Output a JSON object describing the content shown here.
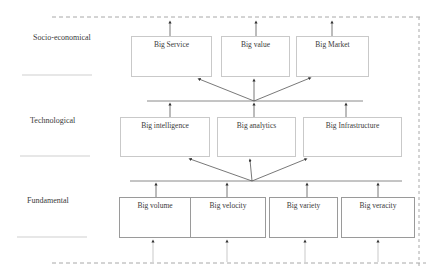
{
  "diagram": {
    "layers": [
      {
        "name": "Socio-economical",
        "boxes": [
          "Big Service",
          "Big value",
          "Big Market"
        ]
      },
      {
        "name": "Technological",
        "boxes": [
          "Big intelligence",
          "Big analytics",
          "Big Infrastructure"
        ]
      },
      {
        "name": "Fundamental",
        "boxes": [
          "Big volume",
          "Big velocity",
          "Big variety",
          "Big veracity"
        ]
      }
    ],
    "colors": {
      "line": "#8a8a8a",
      "dashed": "#a8a8a8",
      "box_border": "#c9c9c9"
    }
  }
}
